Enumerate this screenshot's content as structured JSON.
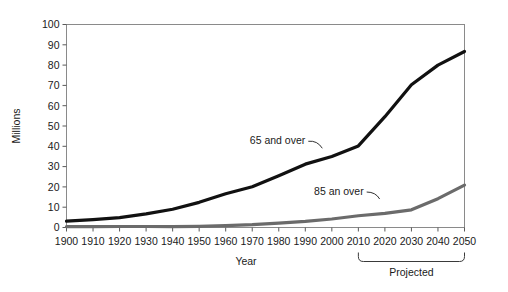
{
  "chart_data": {
    "type": "line",
    "title": "",
    "subtitle": "",
    "xlabel": "Year",
    "ylabel": "Millions",
    "xlim": [
      1900,
      2050
    ],
    "ylim": [
      0,
      100
    ],
    "grid": false,
    "legend_position": "inline-annotations",
    "x": [
      1900,
      1910,
      1920,
      1930,
      1940,
      1950,
      1960,
      1970,
      1980,
      1990,
      2000,
      2010,
      2020,
      2030,
      2040,
      2050
    ],
    "xticklabels": [
      "1900",
      "1910",
      "1920",
      "1930",
      "1940",
      "1950",
      "1960",
      "1970",
      "1980",
      "1990",
      "2000",
      "2010",
      "2020",
      "2030",
      "2040",
      "2050"
    ],
    "yticks": [
      0,
      10,
      20,
      30,
      40,
      50,
      60,
      70,
      80,
      90,
      100
    ],
    "yticklabels": [
      "0",
      "10",
      "20",
      "30",
      "40",
      "50",
      "60",
      "70",
      "80",
      "90",
      "100"
    ],
    "series": [
      {
        "name": "65 and over",
        "color": "#111111",
        "width": 3.2,
        "values": [
          3.1,
          3.9,
          4.9,
          6.7,
          9.0,
          12.4,
          16.6,
          20.1,
          25.5,
          31.2,
          35.0,
          40.2,
          54.6,
          70.3,
          80.0,
          86.7
        ]
      },
      {
        "name": "85 an over",
        "color": "#6b6b6b",
        "width": 3.2,
        "values": [
          0.4,
          0.4,
          0.5,
          0.5,
          0.4,
          0.6,
          0.9,
          1.4,
          2.2,
          3.0,
          4.2,
          5.8,
          7.0,
          8.7,
          14.2,
          20.9
        ]
      }
    ],
    "annotations": [
      {
        "name": "series-label-65",
        "text": "65 and over",
        "x": 1990,
        "y": 41
      },
      {
        "name": "series-label-85",
        "text": "85 an over",
        "x": 2012,
        "y": 16
      },
      {
        "name": "projected-bracket-label",
        "text": "Projected",
        "x": 2030,
        "y": -18
      }
    ],
    "bracket": {
      "from": 2010,
      "to": 2050,
      "label": "Projected"
    }
  },
  "axes": {
    "y_axis_title": "Millions",
    "x_axis_title": "Year"
  }
}
